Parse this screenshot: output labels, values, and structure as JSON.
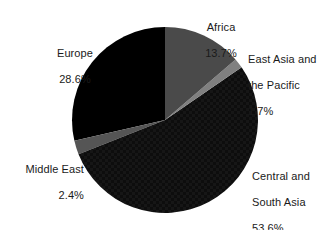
{
  "chart_data": {
    "type": "pie",
    "title": "",
    "subtitle": "",
    "xlabel": "",
    "ylabel": "",
    "legend_position": "none",
    "grid": false,
    "labels_show_percent": true,
    "start_angle_deg": 0,
    "direction": "clockwise",
    "background_color": "#ffffff",
    "text_color": "#1a1a1a",
    "categories": [
      "Africa",
      "East Asia and the Pacific",
      "Central and South Asia",
      "Middle East",
      "Europe"
    ],
    "values": [
      13.7,
      1.7,
      53.6,
      2.4,
      28.6
    ],
    "units": "percent",
    "slices": [
      {
        "name": "Africa",
        "label_line1": "Africa",
        "label_line2": "13.7%",
        "value": 13.7,
        "value_text": "13.7%",
        "color": "#4a4a4a",
        "start_deg": 0.0,
        "end_deg": 49.32
      },
      {
        "name": "East Asia and the Pacific",
        "label_line1": "East Asia and",
        "label_line2": "the Pacific",
        "label_line3": "1.7%",
        "value": 1.7,
        "value_text": "1.7%",
        "color": "#808080",
        "start_deg": 49.32,
        "end_deg": 55.44
      },
      {
        "name": "Central and South Asia",
        "label_line1": "Central and",
        "label_line2": "South Asia",
        "label_line3": "53.6%",
        "value": 53.6,
        "value_text": "53.6%",
        "color": "#0f0f0f",
        "start_deg": 55.44,
        "end_deg": 248.4
      },
      {
        "name": "Middle East",
        "label_line1": "Middle East",
        "label_line2": "2.4%",
        "value": 2.4,
        "value_text": "2.4%",
        "color": "#555555",
        "start_deg": 248.4,
        "end_deg": 257.04
      },
      {
        "name": "Europe",
        "label_line1": "Europe",
        "label_line2": "28.6%",
        "value": 28.6,
        "value_text": "28.6%",
        "color": "#000000",
        "start_deg": 257.04,
        "end_deg": 360.0
      }
    ]
  },
  "labels": {
    "africa": {
      "name": "Africa",
      "value": "13.7%"
    },
    "east_asia": {
      "name_line1": "East Asia and",
      "name_line2": "the Pacific",
      "value": "1.7%"
    },
    "central_south_asia": {
      "name_line1": "Central and",
      "name_line2": "South Asia",
      "value": "53.6%"
    },
    "middle_east": {
      "name": "Middle East",
      "value": "2.4%"
    },
    "europe": {
      "name": "Europe",
      "value": "28.6%"
    }
  }
}
